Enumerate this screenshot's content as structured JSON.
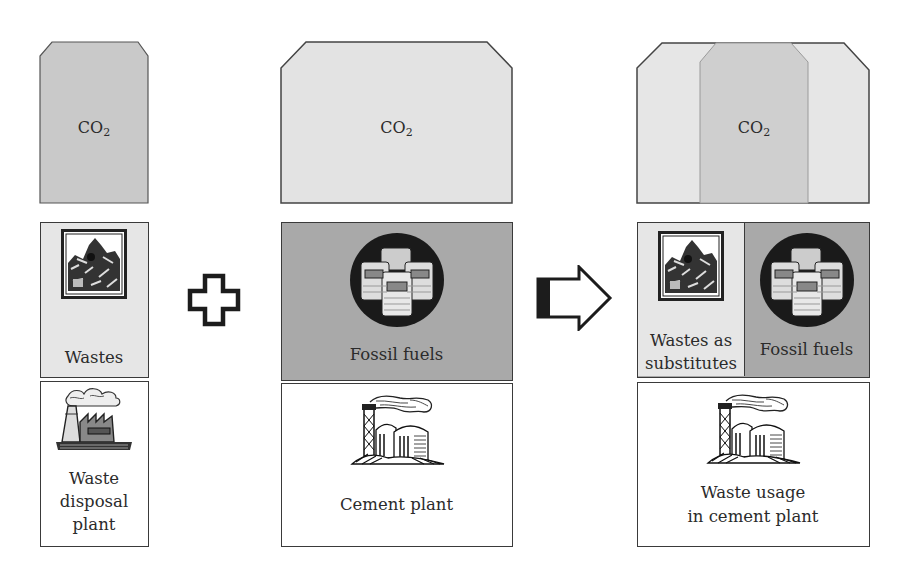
{
  "diagram": {
    "left": {
      "emission": {
        "label": "CO",
        "subscript": "2"
      },
      "input": {
        "label": "Wastes",
        "icon": "waste-pile-icon"
      },
      "plant": {
        "label_lines": [
          "Waste",
          "disposal",
          "plant"
        ],
        "icon": "waste-disposal-factory-icon"
      }
    },
    "operator_plus": {
      "icon": "plus-icon"
    },
    "middle": {
      "emission": {
        "label": "CO",
        "subscript": "2"
      },
      "input": {
        "label": "Fossil fuels",
        "icon": "oil-barrels-icon"
      },
      "plant": {
        "label": "Cement plant",
        "icon": "cement-plant-icon"
      }
    },
    "operator_arrow": {
      "icon": "right-arrow-icon"
    },
    "right": {
      "emission": {
        "label": "CO",
        "subscript": "2"
      },
      "input_left": {
        "label_lines": [
          "Wastes as",
          "substitutes"
        ],
        "icon": "waste-pile-icon"
      },
      "input_right": {
        "label": "Fossil fuels",
        "icon": "oil-barrels-icon"
      },
      "plant": {
        "label_lines": [
          "Waste usage",
          "in cement plant"
        ],
        "icon": "cement-plant-icon"
      }
    },
    "colors": {
      "co2_dark": "#c9c9c9",
      "co2_light": "#e4e4e4",
      "wastes_fill": "#e6e6e6",
      "fossil_fill": "#a9a9a9",
      "outline": "#3a3a3a",
      "plant_fill": "#ffffff"
    }
  }
}
